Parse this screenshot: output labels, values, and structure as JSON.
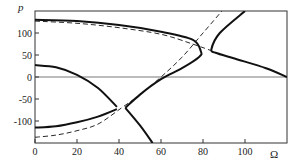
{
  "chart_data": {
    "type": "line",
    "title": "",
    "xlabel": "Ω",
    "ylabel": "p",
    "xlim": [
      0,
      120
    ],
    "ylim": [
      -150,
      150
    ],
    "xticks": [
      0,
      20,
      40,
      60,
      80,
      100
    ],
    "yticks": [
      100,
      50,
      0,
      -50,
      -100
    ],
    "xtick_labels": [
      "0",
      "20",
      "40",
      "60",
      "80",
      "100"
    ],
    "ytick_labels": [
      "100",
      "50",
      "0",
      "-50",
      "-100"
    ],
    "grid": false,
    "zero_line": true,
    "legend": null,
    "series": [
      {
        "name": "solid-upper-left",
        "style": "solid",
        "x": [
          0,
          20,
          40,
          60,
          75,
          79,
          78,
          70,
          60,
          50,
          43
        ],
        "y": [
          130,
          127,
          118,
          103,
          85,
          58,
          45,
          20,
          -5,
          -40,
          -70
        ]
      },
      {
        "name": "solid-upper-right",
        "style": "solid",
        "x": [
          100,
          88,
          84,
          86,
          95,
          110,
          120
        ],
        "y": [
          150,
          100,
          63,
          55,
          42,
          20,
          0
        ]
      },
      {
        "name": "solid-lower-left-top",
        "style": "solid",
        "x": [
          0,
          10,
          20,
          30,
          39
        ],
        "y": [
          27,
          22,
          5,
          -25,
          -68
        ]
      },
      {
        "name": "solid-lower-left-bottom",
        "style": "solid",
        "x": [
          0,
          10,
          20,
          30,
          39
        ],
        "y": [
          -115,
          -112,
          -103,
          -90,
          -73
        ]
      },
      {
        "name": "solid-lower-right",
        "style": "solid",
        "x": [
          43,
          50,
          56
        ],
        "y": [
          -70,
          -110,
          -150
        ]
      },
      {
        "name": "dashed-upper",
        "style": "dashed",
        "x": [
          0,
          20,
          40,
          60,
          75,
          85
        ],
        "y": [
          127,
          122,
          112,
          97,
          75,
          58
        ]
      },
      {
        "name": "dashed-diagonal",
        "style": "dashed",
        "x": [
          0,
          10,
          20,
          30,
          41,
          50,
          60,
          70,
          80,
          89
        ],
        "y": [
          -137,
          -132,
          -122,
          -107,
          -71,
          -40,
          0,
          45,
          100,
          150
        ]
      }
    ]
  }
}
